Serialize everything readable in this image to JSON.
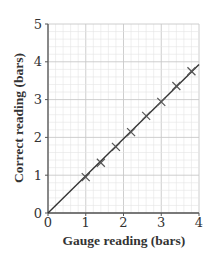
{
  "chart_data": {
    "type": "scatter",
    "title": "",
    "xlabel": "Gauge reading (bars)",
    "ylabel": "Correct reading (bars)",
    "xlim": [
      0,
      4
    ],
    "ylim": [
      0,
      5
    ],
    "xticks": [
      0,
      1,
      2,
      3,
      4
    ],
    "yticks": [
      0,
      1,
      2,
      3,
      4,
      5
    ],
    "grid": true,
    "grid_minor_step": 0.2,
    "marker": "x",
    "series": [
      {
        "name": "Measurements",
        "x": [
          1.0,
          1.4,
          1.8,
          2.2,
          2.6,
          3.0,
          3.4,
          3.8
        ],
        "y": [
          0.95,
          1.33,
          1.75,
          2.14,
          2.57,
          2.94,
          3.36,
          3.75
        ]
      }
    ],
    "fit_line": {
      "x": [
        0,
        4
      ],
      "y": [
        0,
        3.93
      ]
    },
    "colors": {
      "axis": "#555555",
      "grid_major": "#c8c8c8",
      "grid_minor": "#e4e4e4",
      "line": "#333333",
      "marker": "#555555"
    }
  }
}
